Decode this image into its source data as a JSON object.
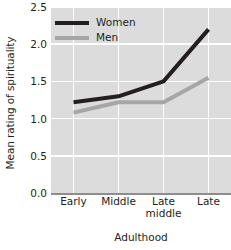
{
  "chart_data": {
    "type": "line",
    "title": "",
    "xlabel": "Adulthood",
    "ylabel": "Mean rating of spirituality",
    "categories": [
      "Early",
      "Middle",
      "Late middle",
      "Late"
    ],
    "category_lines": [
      [
        "Early"
      ],
      [
        "Middle"
      ],
      [
        "Late",
        "middle"
      ],
      [
        "Late"
      ]
    ],
    "series": [
      {
        "name": "Women",
        "values": [
          1.22,
          1.3,
          1.5,
          2.2
        ],
        "color": "#231f20"
      },
      {
        "name": "Men",
        "values": [
          1.08,
          1.22,
          1.22,
          1.55
        ],
        "color": "#a6a6a6"
      }
    ],
    "ylim": [
      0.0,
      2.5
    ],
    "yticks": [
      0.0,
      0.5,
      1.0,
      1.5,
      2.0,
      2.5
    ],
    "ytick_labels": [
      "0.0",
      "0.5",
      "1.0",
      "1.5",
      "2.0",
      "2.5"
    ],
    "grid": true,
    "grid_color": "#ffffff",
    "plot_background": "#dcdcdc",
    "legend_position": "top-left",
    "axis_color": "#8d8d8d"
  }
}
